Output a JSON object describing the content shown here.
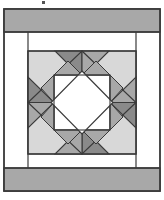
{
  "figure": {
    "type": "pieced-quilt-block-with-border",
    "canvas": {
      "width": 164,
      "height": 200
    },
    "background_color": "#ffffff"
  },
  "palette": {
    "white": "#ffffff",
    "light_gray": "#d8d8d8",
    "medium_gray": "#a8a8a8",
    "dark_gray": "#8a8a8a",
    "outline": "#3a3a3a",
    "speck": "#555555"
  },
  "layout": {
    "outer_frame": {
      "x": 4,
      "y": 9,
      "width": 156,
      "height": 182
    },
    "top_band": {
      "x": 4,
      "y": 9,
      "width": 156,
      "height": 23,
      "fill": "medium_gray",
      "label": "top border strip"
    },
    "bottom_band": {
      "x": 4,
      "y": 168,
      "width": 156,
      "height": 23,
      "fill": "medium_gray",
      "label": "bottom border strip"
    },
    "left_sash": {
      "x": 4,
      "y": 32,
      "width": 24,
      "height": 136,
      "fill": "white",
      "label": "left sashing strip"
    },
    "right_sash": {
      "x": 136,
      "y": 32,
      "width": 24,
      "height": 136,
      "fill": "white",
      "label": "right sashing strip"
    },
    "top_inner_sash": {
      "x": 28,
      "y": 32,
      "width": 108,
      "height": 19,
      "fill": "white",
      "label": "top inner sashing"
    },
    "bottom_inner_sash": {
      "x": 28,
      "y": 154,
      "width": 108,
      "height": 14,
      "fill": "white",
      "label": "bottom inner sashing"
    },
    "block": {
      "x": 28,
      "y": 51,
      "width": 108,
      "height": 103,
      "fill": "light_gray",
      "label": "central pieced block"
    }
  },
  "block_pieces": [
    {
      "name": "corner-triangle-top-left",
      "shade": "light_gray"
    },
    {
      "name": "corner-triangle-top-right",
      "shade": "light_gray"
    },
    {
      "name": "corner-triangle-bottom-left",
      "shade": "light_gray"
    },
    {
      "name": "corner-triangle-bottom-right",
      "shade": "light_gray"
    },
    {
      "name": "point-triangle-top-left",
      "shade": "dark_gray"
    },
    {
      "name": "point-triangle-top-right",
      "shade": "medium_gray"
    },
    {
      "name": "point-triangle-right-top",
      "shade": "medium_gray"
    },
    {
      "name": "point-triangle-right-bottom",
      "shade": "dark_gray"
    },
    {
      "name": "point-triangle-bottom-right",
      "shade": "dark_gray"
    },
    {
      "name": "point-triangle-bottom-left",
      "shade": "medium_gray"
    },
    {
      "name": "point-triangle-left-bottom",
      "shade": "medium_gray"
    },
    {
      "name": "point-triangle-left-top",
      "shade": "dark_gray"
    },
    {
      "name": "inner-triangle-top-left",
      "shade": "white"
    },
    {
      "name": "inner-triangle-top-right",
      "shade": "white"
    },
    {
      "name": "inner-triangle-bottom-right",
      "shade": "white"
    },
    {
      "name": "inner-triangle-bottom-left",
      "shade": "white"
    },
    {
      "name": "inner-kite-top-left",
      "shade": "medium_gray"
    },
    {
      "name": "inner-kite-top-right",
      "shade": "medium_gray"
    },
    {
      "name": "inner-kite-bottom-right",
      "shade": "medium_gray"
    },
    {
      "name": "inner-kite-bottom-left",
      "shade": "medium_gray"
    },
    {
      "name": "center-diamond",
      "shade": "white"
    }
  ],
  "marks": {
    "speck": {
      "x": 42,
      "y": 1,
      "size": 3,
      "label": "stray ink speck"
    }
  }
}
